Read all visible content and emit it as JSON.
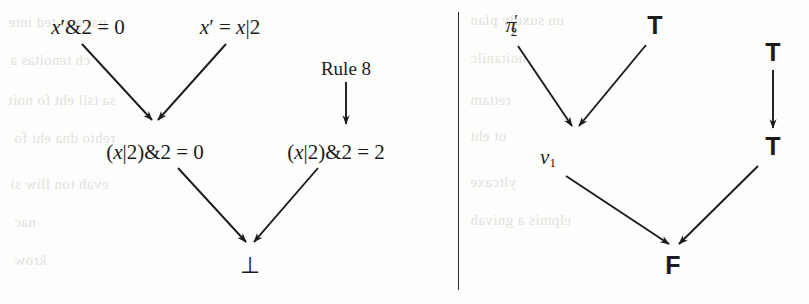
{
  "figure": {
    "type": "conflict-derivation-graph-pair",
    "background_color": "#fdfdfc",
    "ink_color": "#1b1b1b",
    "divider": {
      "name": "vertical-rule",
      "x": 458,
      "y1": 12,
      "y2": 290
    }
  },
  "left_graph": {
    "name": "constraint-conflict-graph",
    "nodes": [
      {
        "id": "n1",
        "text": "x′&2 = 0",
        "x": 88,
        "y": 27,
        "style": "math"
      },
      {
        "id": "n2",
        "text": "x′ = x|2",
        "x": 230,
        "y": 27,
        "style": "math"
      },
      {
        "id": "n3",
        "text": "(x|2)&2 = 0",
        "x": 155,
        "y": 152,
        "style": "math"
      },
      {
        "id": "n4",
        "text": "(x|2)&2 = 2",
        "x": 336,
        "y": 152,
        "style": "math"
      },
      {
        "id": "n5",
        "text": "⊥",
        "x": 250,
        "y": 265,
        "style": "math"
      }
    ],
    "rule_label": {
      "text": "Rule 8",
      "x": 346,
      "y": 68,
      "style": "label"
    },
    "edges": [
      {
        "from": "n1",
        "to": "n3",
        "x1": 82,
        "y1": 44,
        "x2": 152,
        "y2": 120
      },
      {
        "from": "n2",
        "to": "n3",
        "x1": 226,
        "y1": 44,
        "x2": 158,
        "y2": 120
      },
      {
        "from": "rule-8-label",
        "to": "n4",
        "x1": 346,
        "y1": 82,
        "x2": 346,
        "y2": 124
      },
      {
        "from": "n3",
        "to": "n5",
        "x1": 178,
        "y1": 168,
        "x2": 246,
        "y2": 242
      },
      {
        "from": "n4",
        "to": "n5",
        "x1": 318,
        "y1": 168,
        "x2": 254,
        "y2": 242
      }
    ]
  },
  "right_graph": {
    "name": "truth-value-propagation-graph",
    "nodes": [
      {
        "id": "r1",
        "text": "π′₂",
        "x": 516,
        "y": 26,
        "style": "math-pi"
      },
      {
        "id": "r2",
        "text": "T",
        "x": 655,
        "y": 25,
        "style": "sans"
      },
      {
        "id": "r3",
        "text": "v₁",
        "x": 548,
        "y": 158,
        "style": "math-v"
      },
      {
        "id": "r4",
        "text": "T",
        "x": 773,
        "y": 52,
        "style": "sans"
      },
      {
        "id": "r5",
        "text": "T",
        "x": 773,
        "y": 146,
        "style": "sans"
      },
      {
        "id": "r6",
        "text": "F",
        "x": 673,
        "y": 265,
        "style": "sans"
      }
    ],
    "edges": [
      {
        "from": "r1",
        "to": "r3",
        "x1": 518,
        "y1": 46,
        "x2": 572,
        "y2": 126
      },
      {
        "from": "r2",
        "to": "r3",
        "x1": 646,
        "y1": 45,
        "x2": 579,
        "y2": 126
      },
      {
        "from": "r4",
        "to": "r5",
        "x1": 773,
        "y1": 70,
        "x2": 773,
        "y2": 128
      },
      {
        "from": "r3",
        "to": "r6",
        "x1": 566,
        "y1": 176,
        "x2": 669,
        "y2": 244
      },
      {
        "from": "r5",
        "to": "r6",
        "x1": 758,
        "y1": 166,
        "x2": 679,
        "y2": 244
      }
    ]
  },
  "bleed_through": {
    "note": "faint mirrored text showing through from the reverse of the scanned page",
    "lines": [
      {
        "text": "pat and ted inte",
        "x": 8,
        "y": 14,
        "size": 15
      },
      {
        "text": "un suxuly plan",
        "x": 470,
        "y": 12,
        "size": 15
      },
      {
        "text": "ch tenoitas a",
        "x": 10,
        "y": 52,
        "size": 15
      },
      {
        "text": "noitanilc",
        "x": 470,
        "y": 50,
        "size": 15
      },
      {
        "text": "sa tsil eht fo noit",
        "x": 8,
        "y": 92,
        "size": 15
      },
      {
        "text": "rettam",
        "x": 470,
        "y": 92,
        "size": 15
      },
      {
        "text": "rehto dna eht fo",
        "x": 14,
        "y": 130,
        "size": 15
      },
      {
        "text": "ot eht",
        "x": 470,
        "y": 128,
        "size": 15
      },
      {
        "text": "evah ton lliw si",
        "x": 10,
        "y": 176,
        "size": 15
      },
      {
        "text": "yltcaxe",
        "x": 470,
        "y": 174,
        "size": 15
      },
      {
        "text": "nac",
        "x": 14,
        "y": 214,
        "size": 15
      },
      {
        "text": "elpmis a gnivah",
        "x": 470,
        "y": 212,
        "size": 15
      },
      {
        "text": "krow",
        "x": 14,
        "y": 252,
        "size": 15
      }
    ]
  }
}
